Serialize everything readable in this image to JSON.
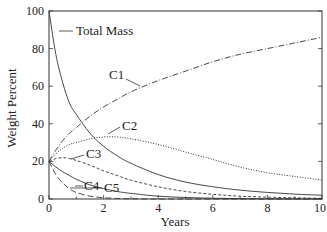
{
  "chart_data": {
    "type": "line",
    "title": "",
    "xlabel": "Years",
    "ylabel": "Weight Percent",
    "xlim": [
      0,
      10
    ],
    "ylim": [
      0,
      100
    ],
    "xticks": [
      0,
      2,
      4,
      6,
      8,
      10
    ],
    "yticks": [
      0,
      20,
      40,
      60,
      80,
      100
    ],
    "grid": false,
    "legend": "inline labels",
    "x": [
      0,
      0.25,
      0.5,
      0.75,
      1,
      1.5,
      2,
      2.5,
      3,
      4,
      5,
      6,
      7,
      8,
      9,
      10
    ],
    "series": [
      {
        "name": "Total Mass",
        "style": "solid",
        "values": [
          100,
          77,
          62,
          51,
          45,
          35,
          28,
          23,
          19,
          13,
          9,
          6.5,
          4.7,
          3.5,
          2.6,
          2
        ]
      },
      {
        "name": "C1",
        "style": "dash-dot",
        "values": [
          20,
          26,
          31,
          35,
          38,
          44,
          49,
          53,
          57,
          63,
          68,
          73,
          77,
          80,
          83,
          86
        ]
      },
      {
        "name": "C2",
        "style": "dotted",
        "values": [
          20,
          24,
          27,
          29,
          30,
          32,
          33,
          33,
          32,
          29,
          25,
          21,
          17,
          14,
          12,
          10
        ]
      },
      {
        "name": "C3",
        "style": "short-dash",
        "values": [
          20,
          21.5,
          22,
          21.5,
          20.5,
          18,
          15,
          12.5,
          10,
          6.5,
          4,
          2.5,
          1.5,
          1,
          0.6,
          0.4
        ]
      },
      {
        "name": "C4",
        "style": "solid",
        "values": [
          20,
          17,
          14.5,
          12.5,
          10.5,
          7.5,
          5.5,
          4,
          3,
          1.5,
          0.8,
          0.4,
          0.2,
          0.1,
          0.05,
          0
        ]
      },
      {
        "name": "C5",
        "style": "long-dash",
        "values": [
          20,
          13,
          8.5,
          5.5,
          3.5,
          1.5,
          0.7,
          0.3,
          0.1,
          0,
          0,
          0,
          0,
          0,
          0,
          0
        ]
      }
    ],
    "annotations": [
      "Total Mass",
      "C1",
      "C2",
      "C3",
      "C4",
      "C5"
    ]
  },
  "axes": {
    "xlabel": "Years",
    "ylabel": "Weight Percent",
    "xtick_labels": [
      "0",
      "2",
      "4",
      "6",
      "8",
      "10"
    ],
    "ytick_labels": [
      "0",
      "20",
      "40",
      "60",
      "80",
      "100"
    ]
  },
  "labels": {
    "total": "Total Mass",
    "c1": "C1",
    "c2": "C2",
    "c3": "C3",
    "c4": "C4",
    "c5": "C5"
  }
}
